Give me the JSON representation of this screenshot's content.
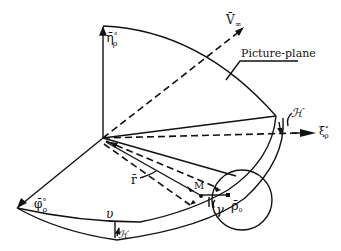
{
  "diagram": {
    "type": "geometric-projection-diagram",
    "labels": {
      "eta": "η̄°ρ",
      "eta_main": "η̄",
      "eta_sup": "°",
      "eta_sub": "ρ",
      "v_inf": "V̄∞",
      "v_main": "V̄",
      "v_sub": "∞",
      "picture_plane": "Picture-plane",
      "kappa_top": "ℋ",
      "xi": "ξ°ρ",
      "xi_main": "ξ",
      "xi_sup": "°",
      "xi_sub": "ρ",
      "phi": "φ̄°ρ",
      "phi_main": "φ̄",
      "phi_sup": "°",
      "phi_sub": "ρ",
      "r": "r̄",
      "M": "M",
      "gamma": "γ",
      "rho0": "ρ̄₀",
      "rho_main": "ρ̄",
      "rho_sub": "₀",
      "upsilon": "υ",
      "kappa_bottom": "ℋ"
    },
    "colors": {
      "stroke": "#111111",
      "background": "#ffffff"
    }
  }
}
